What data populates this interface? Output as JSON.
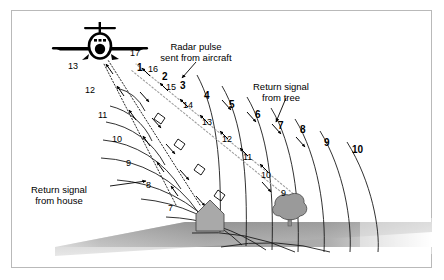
{
  "figure": {
    "border_color": "#b9b9b9",
    "background_color": "#ffffff",
    "ink_color": "#000000",
    "ground_color": "#8d8d8d",
    "object_fill": "#a8a8a8",
    "return_path_color": "#a9a9a9"
  },
  "annotations": [
    {
      "name": "radar-pulse-annotation",
      "line1": "Radar pulse",
      "line2": "sent from aircraft",
      "x": 196,
      "y": 42
    },
    {
      "name": "return-tree-annotation",
      "line1": "Return signal",
      "line2": "from tree",
      "x": 281,
      "y": 82
    },
    {
      "name": "return-house-annotation",
      "line1": "Return signal",
      "line2": "from house",
      "x": 59,
      "y": 185
    }
  ],
  "outgoing_arc_labels": [
    {
      "text": "1",
      "x": 137,
      "y": 62
    },
    {
      "text": "2",
      "x": 162,
      "y": 71
    },
    {
      "text": "3",
      "x": 180,
      "y": 80
    },
    {
      "text": "4",
      "x": 204,
      "y": 90
    },
    {
      "text": "5",
      "x": 229,
      "y": 99
    },
    {
      "text": "6",
      "x": 255,
      "y": 109
    },
    {
      "text": "7",
      "x": 278,
      "y": 120
    },
    {
      "text": "8",
      "x": 300,
      "y": 124
    },
    {
      "text": "9",
      "x": 324,
      "y": 137
    },
    {
      "text": "10",
      "x": 352,
      "y": 144
    }
  ],
  "return_path_labels": [
    {
      "text": "17",
      "x": 130,
      "y": 48
    },
    {
      "text": "16",
      "x": 148,
      "y": 64
    },
    {
      "text": "15",
      "x": 166,
      "y": 82
    },
    {
      "text": "14",
      "x": 183,
      "y": 100
    },
    {
      "text": "13",
      "x": 202,
      "y": 117
    },
    {
      "text": "12",
      "x": 222,
      "y": 134
    },
    {
      "text": "11",
      "x": 243,
      "y": 152
    },
    {
      "text": "10",
      "x": 261,
      "y": 170
    },
    {
      "text": "9",
      "x": 281,
      "y": 188
    },
    {
      "text": "13",
      "x": 68,
      "y": 61
    },
    {
      "text": "12",
      "x": 85,
      "y": 85
    },
    {
      "text": "11",
      "x": 98,
      "y": 110
    },
    {
      "text": "10",
      "x": 112,
      "y": 134
    },
    {
      "text": "9",
      "x": 126,
      "y": 158
    },
    {
      "text": "8",
      "x": 146,
      "y": 180
    },
    {
      "text": "7",
      "x": 168,
      "y": 203
    }
  ],
  "scene_objects": [
    {
      "name": "aircraft",
      "label": "aircraft-silhouette",
      "x": 100,
      "y": 40
    },
    {
      "name": "house",
      "label": "house-shape",
      "x": 210,
      "y": 215
    },
    {
      "name": "tree",
      "label": "tree-shape",
      "x": 290,
      "y": 207
    },
    {
      "name": "ground",
      "label": "ground-plane",
      "x": 222,
      "y": 250
    }
  ]
}
